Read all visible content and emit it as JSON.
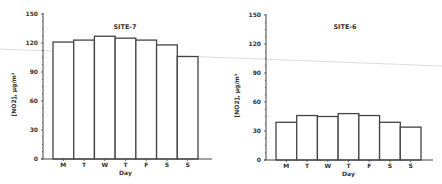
{
  "chart_data": [
    {
      "type": "bar",
      "title": "SITE-7",
      "xlabel": "Day",
      "ylabel": "[NO2], µg/m³",
      "categories": [
        "M",
        "T",
        "W",
        "T",
        "F",
        "S",
        "S"
      ],
      "values": [
        121,
        123,
        127,
        125,
        123,
        118,
        106
      ],
      "ylim": [
        0,
        150
      ],
      "yticks": [
        0,
        30,
        60,
        90,
        120,
        150
      ],
      "grid": false,
      "legend": null
    },
    {
      "type": "bar",
      "title": "SITE-6",
      "xlabel": "Day",
      "ylabel": "[NO2], µg/m³",
      "categories": [
        "M",
        "T",
        "W",
        "T",
        "F",
        "S",
        "S"
      ],
      "values": [
        39,
        46,
        45,
        48,
        46,
        39,
        34
      ],
      "ylim": [
        0,
        150
      ],
      "yticks": [
        0,
        30,
        60,
        90,
        120,
        150
      ],
      "grid": false,
      "legend": null
    }
  ],
  "colors": {
    "bar_fill": "#ffffff",
    "bar_stroke": "#444444",
    "axis": "#444444",
    "scan_line": "#d8d8d8"
  }
}
